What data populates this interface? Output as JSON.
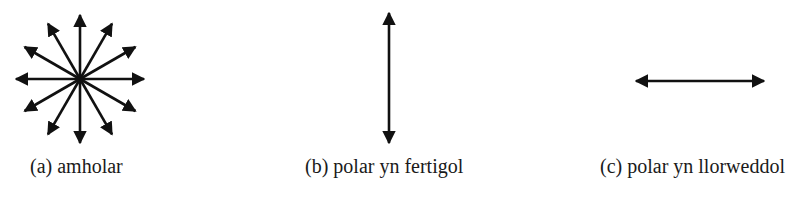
{
  "diagram": {
    "panels": [
      {
        "id": "a",
        "caption": "(a) amholar",
        "arrow_type": "starburst-12-directions",
        "arrow_count": 12
      },
      {
        "id": "b",
        "caption": "(b) polar yn fertigol",
        "arrow_type": "double-headed-vertical"
      },
      {
        "id": "c",
        "caption": "(c) polar yn llorweddol",
        "arrow_type": "double-headed-horizontal"
      }
    ],
    "colors": {
      "arrow": "#111111",
      "text": "#1a1a1a",
      "background": "#ffffff"
    }
  }
}
